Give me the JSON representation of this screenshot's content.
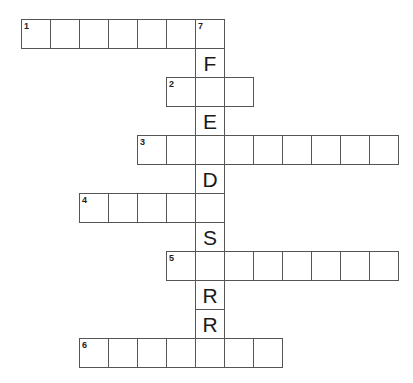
{
  "puzzle": {
    "cell_size": 29,
    "origin": {
      "x": 21,
      "y": 19
    },
    "grid_color": "#555555",
    "words": [
      {
        "number": "1",
        "direction": "across",
        "row": 0,
        "col": 0,
        "length": 7,
        "letters": [
          "",
          "",
          "",
          "",
          "",
          "",
          ""
        ]
      },
      {
        "number": "2",
        "direction": "across",
        "row": 2,
        "col": 5,
        "length": 3,
        "letters": [
          "",
          "",
          ""
        ]
      },
      {
        "number": "3",
        "direction": "across",
        "row": 4,
        "col": 4,
        "length": 9,
        "letters": [
          "",
          "",
          "",
          "",
          "",
          "",
          "",
          "",
          ""
        ]
      },
      {
        "number": "4",
        "direction": "across",
        "row": 6,
        "col": 2,
        "length": 5,
        "letters": [
          "",
          "",
          "",
          "",
          ""
        ]
      },
      {
        "number": "5",
        "direction": "across",
        "row": 8,
        "col": 5,
        "length": 8,
        "letters": [
          "",
          "",
          "",
          "",
          "",
          "",
          "",
          ""
        ]
      },
      {
        "number": "6",
        "direction": "across",
        "row": 11,
        "col": 2,
        "length": 7,
        "letters": [
          "",
          "",
          "",
          "",
          "",
          "",
          ""
        ]
      },
      {
        "number": "7",
        "direction": "down",
        "row": 0,
        "col": 6,
        "length": 12,
        "letters": [
          "",
          "F",
          "",
          "E",
          "",
          "D",
          "",
          "S",
          "",
          "R",
          "R",
          ""
        ]
      }
    ]
  }
}
